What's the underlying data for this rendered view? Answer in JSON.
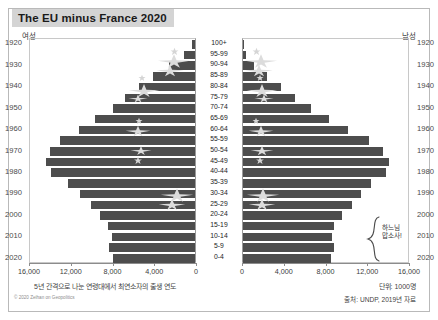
{
  "header": {
    "title": "The EU minus France 2020"
  },
  "axes": {
    "left_gender": "여성",
    "right_gender": "남성",
    "tick_labels_left": [
      "16,000",
      "12,000",
      "8,000",
      "4,000",
      "0"
    ],
    "tick_labels_right": [
      "0",
      "4,000",
      "8,000",
      "12,000",
      "16,000"
    ],
    "year_labels": [
      "1920",
      "1930",
      "1940",
      "1950",
      "1960",
      "1970",
      "1980",
      "1990",
      "2000",
      "2010",
      "2020"
    ]
  },
  "notes": {
    "x_axis_note": "5년 간격으로 나눈 연령대에서 최연소자의 출생 연도",
    "unit_note": "단위: 1000명",
    "credit": "© 2020 Zeihan on Geopolitics",
    "source": "출처: UNDP, 2019년 자료"
  },
  "annotation": {
    "bracket_label": "하느님\n맙소사!",
    "bracket_label_line1": "하느님",
    "bracket_label_line2": "맙소사!"
  },
  "chart_data": {
    "type": "bar",
    "title": "The EU minus France 2020",
    "subtype": "population-pyramid",
    "xlabel": "",
    "ylabel": "",
    "xlim": [
      0,
      16000
    ],
    "unit": "thousands",
    "grid": false,
    "legend": [
      "여성",
      "남성"
    ],
    "categories": [
      "100+",
      "95-99",
      "90-94",
      "85-89",
      "80-84",
      "75-79",
      "70-74",
      "65-69",
      "60-64",
      "55-59",
      "50-54",
      "45-49",
      "40-44",
      "35-39",
      "30-34",
      "25-29",
      "20-24",
      "15-19",
      "10-14",
      "5-9",
      "0-4"
    ],
    "birth_years": [
      "1920",
      "1925",
      "1930",
      "1935",
      "1940",
      "1945",
      "1950",
      "1955",
      "1960",
      "1965",
      "1970",
      "1975",
      "1980",
      "1985",
      "1990",
      "1995",
      "2000",
      "2005",
      "2010",
      "2015",
      "2020"
    ],
    "series": [
      {
        "name": "여성",
        "side": "left",
        "values": [
          260,
          1050,
          2500,
          4000,
          5400,
          6700,
          7900,
          9600,
          11100,
          12900,
          13900,
          14300,
          13800,
          12200,
          11000,
          10000,
          9100,
          8300,
          8000,
          8200,
          7900
        ]
      },
      {
        "name": "남성",
        "side": "right",
        "values": [
          60,
          310,
          1100,
          2300,
          3600,
          5000,
          6500,
          8200,
          10100,
          12100,
          13400,
          14000,
          13700,
          12300,
          11300,
          10400,
          9500,
          8700,
          8500,
          8700,
          8400
        ]
      }
    ]
  }
}
